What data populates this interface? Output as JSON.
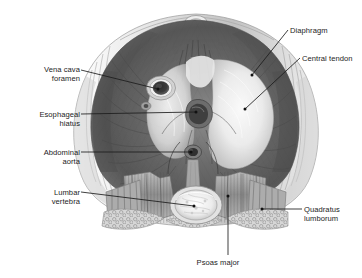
{
  "figure": {
    "background_color": "#ffffff",
    "ink_color": "#1c1c1c",
    "style": "grayscale medical illustration with leader-line callouts"
  },
  "labels": {
    "vena_cava_foramen": {
      "line1": "Vena cava",
      "line2": "foramen"
    },
    "esophageal_hiatus": {
      "line1": "Esophageal",
      "line2": "hiatus"
    },
    "abdominal_aorta": {
      "line1": "Abdominal",
      "line2": "aorta"
    },
    "lumbar_vertebra": {
      "line1": "Lumbar",
      "line2": "vertebra"
    },
    "diaphragm": {
      "line1": "Diaphragm"
    },
    "central_tendon": {
      "line1": "Central tendon"
    },
    "quadratus_lumborum": {
      "line1": "Quadratus",
      "line2": "lumborum"
    },
    "psoas_major": {
      "line1": "Psoas major"
    }
  },
  "structures": [
    {
      "name": "diaphragm-muscle",
      "tone": "#5f5f5f"
    },
    {
      "name": "central-tendon",
      "tone": "#f2f2f2"
    },
    {
      "name": "vena-cava-foramen",
      "tone": "#3a3a3a"
    },
    {
      "name": "esophageal-hiatus",
      "tone": "#4a4a4a"
    },
    {
      "name": "abdominal-aorta",
      "tone": "#3f3f3f"
    },
    {
      "name": "lumbar-vertebra",
      "tone": "#e6e6e6"
    },
    {
      "name": "psoas-major",
      "tone": "#9a9a9a"
    },
    {
      "name": "quadratus-lumborum",
      "tone": "#a5a5a5"
    },
    {
      "name": "body-wall",
      "tone": "#d8d8d8"
    },
    {
      "name": "retroperitoneal-fat",
      "tone": "#c9c9c9"
    }
  ]
}
